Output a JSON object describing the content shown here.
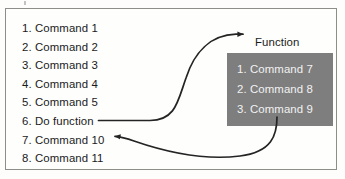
{
  "diagram": {
    "type": "flow-of-control-function-call",
    "frame": {
      "border_color": "#8d8d8a",
      "background": "#fefefd"
    },
    "main_list": {
      "name": "main-program-listing",
      "items": [
        "1. Command 1",
        "2. Command 2",
        "3. Command 3",
        "4. Command 4",
        "5. Command 5",
        "6. Do function",
        "7. Command 10",
        "8. Command 11"
      ]
    },
    "function_label": "Function",
    "function_box": {
      "name": "function-body-box",
      "fill_color": "#7e7e7e",
      "text_color": "#f2f2f2",
      "items": [
        "1. Command 7",
        "2. Command 8",
        "3. Command 9"
      ]
    },
    "arrows": [
      {
        "name": "call-arrow",
        "from": "6. Do function",
        "to": "Function",
        "direction": "right",
        "color": "#242424"
      },
      {
        "name": "return-arrow",
        "from": "function-body-box",
        "to": "7. Command 10",
        "direction": "left",
        "color": "#242424"
      }
    ]
  }
}
